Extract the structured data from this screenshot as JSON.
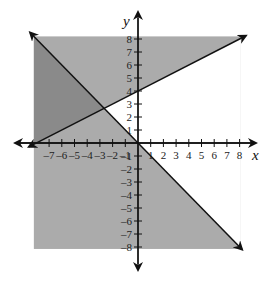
{
  "chart_data": {
    "type": "line",
    "title": "",
    "xlabel": "x",
    "ylabel": "y",
    "xlim": [
      -8,
      8
    ],
    "ylim": [
      -8,
      8
    ],
    "grid": false,
    "x_ticks": [
      -7,
      -6,
      -5,
      -4,
      -3,
      -2,
      -1,
      1,
      2,
      3,
      4,
      5,
      6,
      7,
      8
    ],
    "y_ticks": [
      -8,
      -7,
      -6,
      -5,
      -4,
      -3,
      -2,
      -1,
      1,
      2,
      3,
      4,
      5,
      6,
      7,
      8
    ],
    "x_tick_labels": [
      "-7",
      "-6",
      "-5",
      "-4",
      "-3",
      "-2",
      "-1",
      "1",
      "2",
      "3",
      "4",
      "5",
      "6",
      "7",
      "8"
    ],
    "y_tick_labels": [
      "-8",
      "-7",
      "-6",
      "-5",
      "-4",
      "-3",
      "-2",
      "-1",
      "1",
      "2",
      "3",
      "4",
      "5",
      "6",
      "7",
      "8"
    ],
    "series": [
      {
        "name": "line 1",
        "equation": "y = -x",
        "slope": -1,
        "intercept": 0,
        "x": [
          -8.5,
          8.2
        ],
        "y": [
          8.5,
          -8.2
        ],
        "arrows": "both"
      },
      {
        "name": "line 2",
        "equation": "y = 0.5x + 4",
        "slope": 0.5,
        "intercept": 4,
        "x": [
          -8.6,
          8.5
        ],
        "y": [
          -0.3,
          8.25
        ],
        "arrows": "both"
      }
    ],
    "regions": [
      {
        "name": "shaded square",
        "x": [
          -8.2,
          8.1
        ],
        "y": [
          -8.15,
          8.2
        ],
        "color": "#ababab"
      },
      {
        "name": "solution (overlap) region",
        "description": "y >= 0.5x + 4 and y <= -x",
        "color": "#8a8a8a"
      },
      {
        "name": "unshaded wedge",
        "description": "y < 0.5x + 4 and y > -x",
        "color": "#ffffff"
      }
    ],
    "intersection": {
      "x": -2.67,
      "y": 2.67
    }
  },
  "colors": {
    "background": "#ffffff",
    "light_shade": "#ababab",
    "dark_shade": "#8a8a8a",
    "line": "#111111"
  },
  "layout": {
    "origin_px": [
      138,
      143
    ],
    "unit_x_px": 12.7,
    "unit_y_px": 13.0,
    "x_axis_px": [
      15,
      260
    ],
    "y_axis_px": [
      12,
      270
    ]
  }
}
